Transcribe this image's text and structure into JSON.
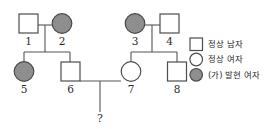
{
  "diagram": {
    "generations": [
      {
        "label": "I",
        "individuals": [
          {
            "id": "1",
            "sex": "male",
            "status": "normal"
          },
          {
            "id": "2",
            "sex": "female",
            "status": "affected"
          },
          {
            "id": "3",
            "sex": "female",
            "status": "affected"
          },
          {
            "id": "4",
            "sex": "male",
            "status": "normal"
          }
        ]
      },
      {
        "label": "II",
        "individuals": [
          {
            "id": "5",
            "sex": "female",
            "status": "affected"
          },
          {
            "id": "6",
            "sex": "male",
            "status": "normal"
          },
          {
            "id": "7",
            "sex": "female",
            "status": "normal"
          },
          {
            "id": "8",
            "sex": "male",
            "status": "normal"
          }
        ]
      },
      {
        "label": "III",
        "individuals": [
          {
            "id": "?",
            "sex": "unknown",
            "status": "unknown"
          }
        ]
      }
    ],
    "matings": [
      {
        "partners": [
          "1",
          "2"
        ],
        "children": [
          "5",
          "6"
        ]
      },
      {
        "partners": [
          "3",
          "4"
        ],
        "children": [
          "7",
          "8"
        ]
      },
      {
        "partners": [
          "6",
          "7"
        ],
        "children": [
          "?"
        ]
      }
    ],
    "labels": {
      "id1": "1",
      "id2": "2",
      "id3": "3",
      "id4": "4",
      "id5": "5",
      "id6": "6",
      "id7": "7",
      "id8": "8",
      "unknown_child": "?"
    }
  },
  "legend": {
    "items": [
      {
        "symbol": "square-outline",
        "label": "정상 남자"
      },
      {
        "symbol": "circle-outline",
        "label": "정상 여자"
      },
      {
        "symbol": "circle-filled",
        "label": "(가) 발현 여자"
      }
    ]
  },
  "colors": {
    "affected_fill": "#8e8e8e",
    "outline": "#4d4d4d",
    "line": "#555555",
    "background": "#ffffff",
    "text": "#1f1f1f"
  }
}
